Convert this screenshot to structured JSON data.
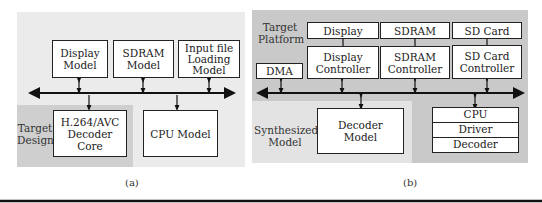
{
  "panel_a": {
    "caption": "(a)",
    "boxes": {
      "display_model": "Display Model",
      "sdram_model": "SDRAM Model",
      "input_file_loading_model": "Input file Loading Model",
      "decoder_core": "H.264/AVC Decoder Core",
      "cpu_model": "CPU Model"
    },
    "region_label": "Target Design"
  },
  "panel_b": {
    "caption": "(b)",
    "region_labels": {
      "target_platform": "Target Platform",
      "synthesized_model": "Synthesized Model"
    },
    "boxes": {
      "display": "Display",
      "sdram": "SDRAM",
      "sd_card": "SD Card",
      "display_controller": "Display Controller",
      "sdram_controller": "SDRAM Controller",
      "sd_card_controller": "SD Card Controller",
      "dma": "DMA",
      "decoder_model": "Decoder Model",
      "cpu_stack": [
        "CPU",
        "Driver",
        "Decoder"
      ]
    }
  },
  "colors": {
    "panel_a_bg": "#ebebeb",
    "target_design_bg": "#cfcfcf",
    "panel_b_bg": "#c9c9c9",
    "synthesized_bg": "#e3e3e3"
  }
}
